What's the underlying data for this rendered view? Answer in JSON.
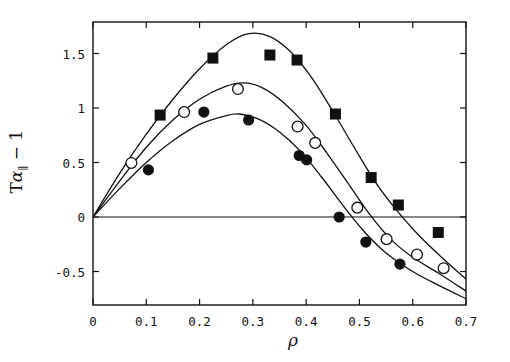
{
  "figure": {
    "width": 510,
    "height": 362,
    "background": "#ffffff",
    "ink_color": "#111111"
  },
  "axes": {
    "frame": {
      "left": 93,
      "right": 466,
      "top": 22,
      "bottom": 305
    },
    "x_label": "ρ",
    "y_label_parts": {
      "pre": "T",
      "alpha": "α",
      "sub": "∥",
      "post": " − 1"
    },
    "y_label_text": "Tα∥ − 1"
  },
  "chart_data": {
    "type": "scatter",
    "title": "",
    "xlabel": "ρ",
    "ylabel": "Tα∥ − 1",
    "xlim": [
      0,
      0.7
    ],
    "ylim": [
      -0.75,
      1.87
    ],
    "grid": false,
    "legend": "none",
    "xticks": [
      0,
      0.1,
      0.2,
      0.3,
      0.4,
      0.5,
      0.6,
      0.7
    ],
    "xticklabels": [
      "0",
      "0.1",
      "0.2",
      "0.3",
      "0.4",
      "0.5",
      "0.6",
      "0.7"
    ],
    "yticks": [
      1.5,
      1,
      0.5,
      0,
      -0.5
    ],
    "yticklabels": [
      "1.5",
      "1",
      "0.5",
      "0",
      "-0.5"
    ],
    "zero_line": {
      "y": 0,
      "from_x": 0,
      "to_x": 0.7
    },
    "series": [
      {
        "name": "filled-square",
        "marker": "filled-square",
        "points": [
          {
            "x": 0.126,
            "y": 0.935
          },
          {
            "x": 0.225,
            "y": 1.458
          },
          {
            "x": 0.332,
            "y": 1.486
          },
          {
            "x": 0.383,
            "y": 1.44
          },
          {
            "x": 0.455,
            "y": 0.945
          },
          {
            "x": 0.522,
            "y": 0.362
          },
          {
            "x": 0.573,
            "y": 0.11
          },
          {
            "x": 0.648,
            "y": -0.142
          }
        ],
        "curve": [
          {
            "x": 0.0,
            "y": 0.0
          },
          {
            "x": 0.05,
            "y": 0.4
          },
          {
            "x": 0.1,
            "y": 0.76
          },
          {
            "x": 0.15,
            "y": 1.08
          },
          {
            "x": 0.2,
            "y": 1.36
          },
          {
            "x": 0.25,
            "y": 1.58
          },
          {
            "x": 0.29,
            "y": 1.68
          },
          {
            "x": 0.33,
            "y": 1.66
          },
          {
            "x": 0.37,
            "y": 1.52
          },
          {
            "x": 0.41,
            "y": 1.28
          },
          {
            "x": 0.45,
            "y": 0.97
          },
          {
            "x": 0.49,
            "y": 0.64
          },
          {
            "x": 0.53,
            "y": 0.32
          },
          {
            "x": 0.57,
            "y": 0.06
          },
          {
            "x": 0.61,
            "y": -0.16
          },
          {
            "x": 0.65,
            "y": -0.35
          },
          {
            "x": 0.7,
            "y": -0.57
          }
        ]
      },
      {
        "name": "open-circle",
        "marker": "open-circle",
        "points": [
          {
            "x": 0.072,
            "y": 0.496
          },
          {
            "x": 0.171,
            "y": 0.963
          },
          {
            "x": 0.272,
            "y": 1.174
          },
          {
            "x": 0.384,
            "y": 0.83
          },
          {
            "x": 0.417,
            "y": 0.68
          },
          {
            "x": 0.496,
            "y": 0.086
          },
          {
            "x": 0.551,
            "y": -0.203
          },
          {
            "x": 0.608,
            "y": -0.345
          },
          {
            "x": 0.658,
            "y": -0.47
          }
        ],
        "curve": [
          {
            "x": 0.0,
            "y": 0.0
          },
          {
            "x": 0.05,
            "y": 0.33
          },
          {
            "x": 0.1,
            "y": 0.64
          },
          {
            "x": 0.15,
            "y": 0.89
          },
          {
            "x": 0.2,
            "y": 1.08
          },
          {
            "x": 0.25,
            "y": 1.2
          },
          {
            "x": 0.285,
            "y": 1.23
          },
          {
            "x": 0.32,
            "y": 1.18
          },
          {
            "x": 0.36,
            "y": 1.04
          },
          {
            "x": 0.4,
            "y": 0.84
          },
          {
            "x": 0.44,
            "y": 0.58
          },
          {
            "x": 0.48,
            "y": 0.3
          },
          {
            "x": 0.52,
            "y": 0.02
          },
          {
            "x": 0.56,
            "y": -0.21
          },
          {
            "x": 0.6,
            "y": -0.37
          },
          {
            "x": 0.65,
            "y": -0.52
          },
          {
            "x": 0.7,
            "y": -0.68
          }
        ]
      },
      {
        "name": "filled-circle",
        "marker": "filled-circle",
        "points": [
          {
            "x": 0.104,
            "y": 0.432
          },
          {
            "x": 0.208,
            "y": 0.963
          },
          {
            "x": 0.292,
            "y": 0.89
          },
          {
            "x": 0.387,
            "y": 0.564
          },
          {
            "x": 0.401,
            "y": 0.524
          },
          {
            "x": 0.462,
            "y": 0.0
          },
          {
            "x": 0.512,
            "y": -0.23
          },
          {
            "x": 0.576,
            "y": -0.432
          }
        ],
        "curve": [
          {
            "x": 0.0,
            "y": 0.0
          },
          {
            "x": 0.05,
            "y": 0.26
          },
          {
            "x": 0.1,
            "y": 0.5
          },
          {
            "x": 0.15,
            "y": 0.7
          },
          {
            "x": 0.2,
            "y": 0.85
          },
          {
            "x": 0.25,
            "y": 0.93
          },
          {
            "x": 0.275,
            "y": 0.945
          },
          {
            "x": 0.31,
            "y": 0.9
          },
          {
            "x": 0.35,
            "y": 0.78
          },
          {
            "x": 0.39,
            "y": 0.6
          },
          {
            "x": 0.43,
            "y": 0.36
          },
          {
            "x": 0.47,
            "y": 0.1
          },
          {
            "x": 0.51,
            "y": -0.14
          },
          {
            "x": 0.55,
            "y": -0.33
          },
          {
            "x": 0.6,
            "y": -0.5
          },
          {
            "x": 0.65,
            "y": -0.63
          },
          {
            "x": 0.7,
            "y": -0.75
          }
        ]
      }
    ]
  }
}
